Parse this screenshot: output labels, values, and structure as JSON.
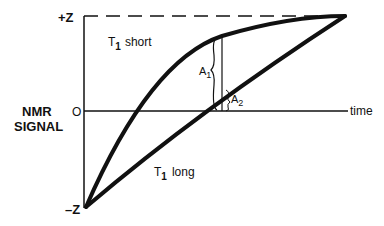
{
  "diagram": {
    "y_axis_title_line1": "NMR",
    "y_axis_title_line2": "SIGNAL",
    "y_tick_top": "+Z",
    "y_tick_zero": "O",
    "y_tick_bottom": "–Z",
    "x_axis_label": "time",
    "curve_short_label": "T",
    "curve_short_sub": "1",
    "curve_short_suffix": "short",
    "curve_long_label": "T",
    "curve_long_sub": "1",
    "curve_long_suffix": "long",
    "amp1_label": "A",
    "amp1_sub": "1",
    "amp2_label": "A",
    "amp2_sub": "2",
    "line_color": "#111111",
    "background": "#ffffff"
  }
}
